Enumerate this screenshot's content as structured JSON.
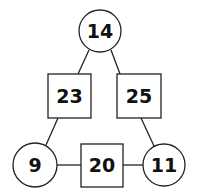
{
  "diagram": {
    "type": "number-triangle",
    "colors": {
      "stroke": "#222222",
      "text": "#111111",
      "background": "#ffffff"
    },
    "nodes": [
      {
        "id": "top",
        "shape": "circle",
        "value": "14",
        "cx": 100,
        "cy": 31,
        "r": 21
      },
      {
        "id": "left-mid",
        "shape": "square",
        "value": "23",
        "x": 48,
        "y": 74,
        "w": 43,
        "h": 44
      },
      {
        "id": "right-mid",
        "shape": "square",
        "value": "25",
        "x": 117,
        "y": 74,
        "w": 44,
        "h": 44
      },
      {
        "id": "bottom-left",
        "shape": "circle",
        "value": "9",
        "cx": 35,
        "cy": 165,
        "r": 22
      },
      {
        "id": "bottom-mid",
        "shape": "square",
        "value": "20",
        "x": 81,
        "y": 144,
        "w": 42,
        "h": 43
      },
      {
        "id": "bottom-right",
        "shape": "circle",
        "value": "11",
        "cx": 164,
        "cy": 165,
        "r": 21
      }
    ],
    "edges": [
      {
        "from": "top",
        "to": "left-mid"
      },
      {
        "from": "top",
        "to": "right-mid"
      },
      {
        "from": "left-mid",
        "to": "bottom-left"
      },
      {
        "from": "right-mid",
        "to": "bottom-right"
      },
      {
        "from": "bottom-left",
        "to": "bottom-mid"
      },
      {
        "from": "bottom-mid",
        "to": "bottom-right"
      }
    ]
  }
}
